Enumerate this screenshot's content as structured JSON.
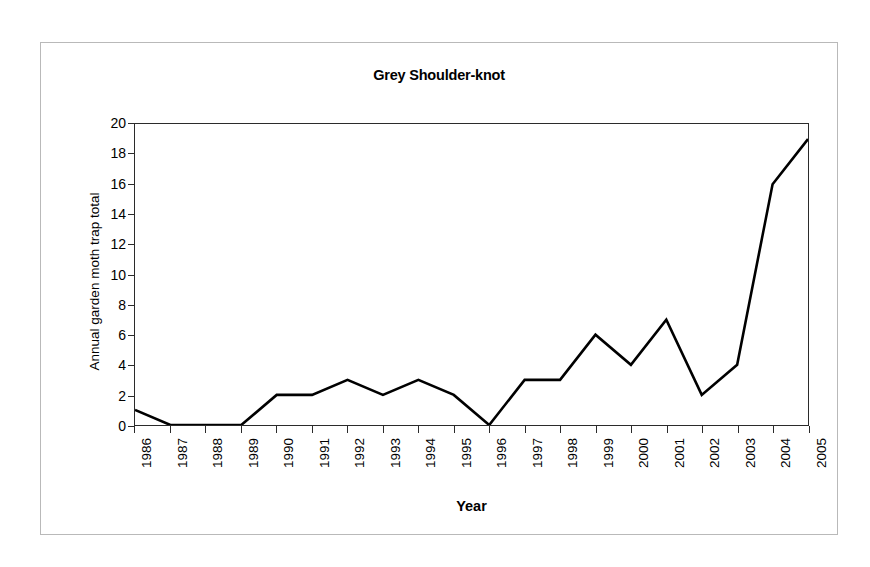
{
  "chart_data": {
    "type": "line",
    "title": "Grey Shoulder-knot",
    "xlabel": "Year",
    "ylabel": "Annual garden moth trap total",
    "categories": [
      "1986",
      "1987",
      "1988",
      "1989",
      "1990",
      "1991",
      "1992",
      "1993",
      "1994",
      "1995",
      "1996",
      "1997",
      "1998",
      "1999",
      "2000",
      "2001",
      "2002",
      "2003",
      "2004",
      "2005"
    ],
    "values": [
      1,
      0,
      0,
      0,
      2,
      2,
      3,
      2,
      3,
      2,
      0,
      3,
      3,
      6,
      4,
      7,
      2,
      4,
      16,
      19
    ],
    "x": [
      1986,
      1987,
      1988,
      1989,
      1990,
      1991,
      1992,
      1993,
      1994,
      1995,
      1996,
      1997,
      1998,
      1999,
      2000,
      2001,
      2002,
      2003,
      2004,
      2005
    ],
    "ylim": [
      0,
      20
    ],
    "ytick_values": [
      0,
      2,
      4,
      6,
      8,
      10,
      12,
      14,
      16,
      18,
      20
    ],
    "ytick_labels": [
      "0",
      "2",
      "4",
      "6",
      "8",
      "10",
      "12",
      "14",
      "16",
      "18",
      "20"
    ],
    "grid": false,
    "legend": null,
    "legend_position": "none",
    "series": [
      {
        "name": "Annual garden moth trap total",
        "color": "#000000",
        "values": [
          1,
          0,
          0,
          0,
          2,
          2,
          3,
          2,
          3,
          2,
          0,
          3,
          3,
          6,
          4,
          7,
          2,
          4,
          16,
          19
        ]
      }
    ]
  },
  "colors": {
    "line": "#000000",
    "axis": "#2b2b2b",
    "frame": "#b9b9b9",
    "background": "#ffffff"
  }
}
